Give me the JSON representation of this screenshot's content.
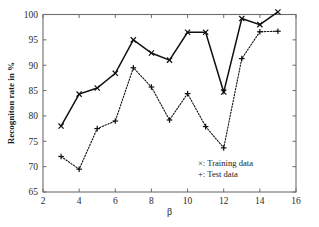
{
  "chart_data": {
    "type": "line",
    "title": "",
    "subtitle": "",
    "xlabel": "β",
    "ylabel": "Recogniton rate in %",
    "xlim": [
      2,
      16
    ],
    "ylim": [
      65,
      100
    ],
    "xticks": [
      2,
      4,
      6,
      8,
      10,
      12,
      14,
      16
    ],
    "yticks": [
      65,
      70,
      75,
      80,
      85,
      90,
      95,
      100
    ],
    "xtick_labels": [
      "2",
      "4",
      "6",
      "8",
      "10",
      "12",
      "14",
      "16"
    ],
    "ytick_labels": [
      "65",
      "70",
      "75",
      "80",
      "85",
      "90",
      "95",
      "100"
    ],
    "grid": false,
    "legend_position": "lower-right",
    "x": [
      3,
      4,
      5,
      6,
      7,
      8,
      9,
      10,
      11,
      12,
      13,
      14,
      15
    ],
    "series": [
      {
        "name": "Training data",
        "legend_label": "×: Training data",
        "marker": "x",
        "linestyle": "solid",
        "color": "#111111",
        "values": [
          78.0,
          84.3,
          85.5,
          88.4,
          95.0,
          92.4,
          91.0,
          96.5,
          96.5,
          84.7,
          99.2,
          98.0,
          100.5
        ]
      },
      {
        "name": "Test data",
        "legend_label": "+: Test data",
        "marker": "+",
        "linestyle": "dotted",
        "color": "#111111",
        "values": [
          72.0,
          69.5,
          77.5,
          79.0,
          89.5,
          85.7,
          79.2,
          84.4,
          77.9,
          73.7,
          91.3,
          96.6,
          96.7
        ]
      }
    ],
    "annotations": []
  },
  "legend": {
    "entries": [
      {
        "label": "×: Training data"
      },
      {
        "label": "+: Test data"
      }
    ]
  },
  "axes": {
    "x_title": "β",
    "y_title": "Recogniton rate in %"
  },
  "colors": {
    "axis": "#6d6d6d",
    "data": "#111111",
    "background": "#ffffff"
  }
}
